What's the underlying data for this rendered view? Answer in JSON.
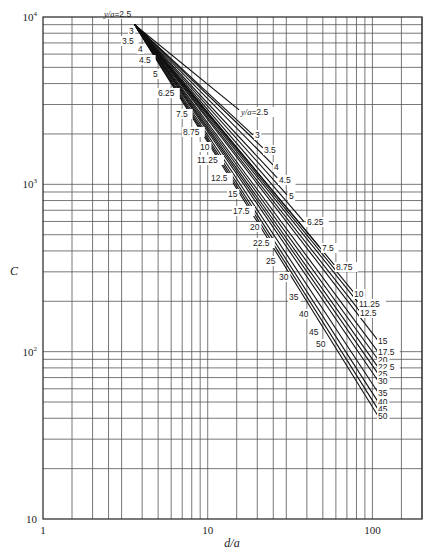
{
  "chart_data": {
    "type": "line",
    "title": "",
    "xlabel": "d/a",
    "ylabel": "C",
    "xscale": "log",
    "yscale": "log",
    "xlim": [
      1,
      200
    ],
    "ylim": [
      10,
      10000
    ],
    "grid": true,
    "legend_position": "inline labels at curve ends",
    "series_label_prefix": "y/a",
    "x_ticks": [
      "1",
      "10",
      "100"
    ],
    "y_ticks": [
      "10",
      "10^2",
      "10^3",
      "10^4"
    ],
    "x_gridlines": [
      1.5,
      2,
      2.5,
      3,
      4,
      5,
      6,
      7,
      8,
      9,
      10,
      15,
      20,
      25,
      30,
      40,
      50,
      60,
      70,
      80,
      90,
      100,
      150,
      200
    ],
    "y_gridlines": [
      20,
      30,
      40,
      50,
      60,
      70,
      80,
      90,
      100,
      200,
      300,
      400,
      500,
      600,
      700,
      800,
      900,
      1000,
      2000,
      3000,
      4000,
      5000,
      6000,
      7000,
      8000,
      9000
    ],
    "series": [
      {
        "name": "2.5",
        "label": "y/a=2.5",
        "x": [
          3.6,
          15.5
        ],
        "y": [
          9000,
          2785
        ]
      },
      {
        "name": "3",
        "label": "3",
        "x": [
          3.6,
          18.8
        ],
        "y": [
          9000,
          1977
        ]
      },
      {
        "name": "3.5",
        "label": "3.5",
        "x": [
          3.6,
          21.6
        ],
        "y": [
          9000,
          1650
        ]
      },
      {
        "name": "4",
        "label": "4",
        "x": [
          3.6,
          24.9
        ],
        "y": [
          9000,
          1306
        ]
      },
      {
        "name": "4.5",
        "label": "4.5",
        "x": [
          3.6,
          26.4
        ],
        "y": [
          9000,
          1093
        ]
      },
      {
        "name": "5",
        "label": "5",
        "x": [
          3.6,
          30.3
        ],
        "y": [
          9000,
          865
        ]
      },
      {
        "name": "6.25",
        "label": "6.25",
        "x": [
          3.6,
          38.5
        ],
        "y": [
          9000,
          597
        ]
      },
      {
        "name": "7.5",
        "label": "7.5",
        "x": [
          3.6,
          47.5
        ],
        "y": [
          9000,
          424
        ]
      },
      {
        "name": "8.75",
        "label": "8.75",
        "x": [
          3.6,
          58.7
        ],
        "y": [
          9000,
          330
        ]
      },
      {
        "name": "10",
        "label": "10",
        "x": [
          3.6,
          76.6
        ],
        "y": [
          9000,
          228
        ]
      },
      {
        "name": "11.25",
        "label": "11.25",
        "x": [
          3.6,
          81.1
        ],
        "y": [
          9000,
          199
        ]
      },
      {
        "name": "12.5",
        "label": "12.5",
        "x": [
          3.6,
          83.4
        ],
        "y": [
          9000,
          176
        ]
      },
      {
        "name": "15",
        "label": "15",
        "x": [
          3.6,
          107
        ],
        "y": [
          9000,
          118
        ]
      },
      {
        "name": "17.5",
        "label": "17.5",
        "x": [
          3.6,
          107
        ],
        "y": [
          9000,
          101
        ]
      },
      {
        "name": "20",
        "label": "20",
        "x": [
          3.6,
          107
        ],
        "y": [
          9000,
          91
        ]
      },
      {
        "name": "22.5",
        "label": "22.5",
        "x": [
          3.6,
          107
        ],
        "y": [
          9000,
          82
        ]
      },
      {
        "name": "25",
        "label": "25",
        "x": [
          3.6,
          107
        ],
        "y": [
          9000,
          75
        ]
      },
      {
        "name": "30",
        "label": "30",
        "x": [
          3.6,
          107
        ],
        "y": [
          9000,
          68
        ]
      },
      {
        "name": "35",
        "label": "35",
        "x": [
          3.6,
          107
        ],
        "y": [
          9000,
          58
        ]
      },
      {
        "name": "40",
        "label": "40",
        "x": [
          3.6,
          107
        ],
        "y": [
          9000,
          51
        ]
      },
      {
        "name": "45",
        "label": "45",
        "x": [
          3.6,
          107
        ],
        "y": [
          9000,
          46
        ]
      },
      {
        "name": "50",
        "label": "50",
        "x": [
          3.6,
          107
        ],
        "y": [
          9000,
          42
        ]
      }
    ],
    "left_labels": [
      {
        "text": "y/a=2.5",
        "px": 104,
        "py": 17
      },
      {
        "text": "3",
        "px": 129,
        "py": 34
      },
      {
        "text": "3.5",
        "px": 122,
        "py": 44
      },
      {
        "text": "4",
        "px": 138,
        "py": 52
      },
      {
        "text": "4.5",
        "px": 139,
        "py": 63
      },
      {
        "text": "5",
        "px": 153,
        "py": 77
      },
      {
        "text": "6.25",
        "px": 158,
        "py": 96
      },
      {
        "text": "7.5",
        "px": 176,
        "py": 117
      },
      {
        "text": "8.75",
        "px": 183,
        "py": 135
      },
      {
        "text": "10",
        "px": 200,
        "py": 150
      },
      {
        "text": "11.25",
        "px": 197,
        "py": 163
      },
      {
        "text": "12.5",
        "px": 211,
        "py": 181
      },
      {
        "text": "15",
        "px": 228,
        "py": 197
      },
      {
        "text": "17.5",
        "px": 233,
        "py": 214
      },
      {
        "text": "20",
        "px": 250,
        "py": 230
      },
      {
        "text": "22.5",
        "px": 253,
        "py": 246
      },
      {
        "text": "25",
        "px": 266,
        "py": 264
      },
      {
        "text": "30",
        "px": 279,
        "py": 280
      },
      {
        "text": "35",
        "px": 289,
        "py": 300
      },
      {
        "text": "40",
        "px": 299,
        "py": 317
      },
      {
        "text": "45",
        "px": 309,
        "py": 335
      },
      {
        "text": "50",
        "px": 316,
        "py": 347
      }
    ],
    "right_labels": [
      {
        "text": "y/a=2.5",
        "px": 241,
        "py": 115
      },
      {
        "text": "3",
        "px": 255,
        "py": 138
      },
      {
        "text": "3.5",
        "px": 264,
        "py": 153
      },
      {
        "text": "4",
        "px": 274,
        "py": 170
      },
      {
        "text": "4.5",
        "px": 279,
        "py": 183
      },
      {
        "text": "5",
        "px": 289,
        "py": 199
      },
      {
        "text": "6.25",
        "px": 307,
        "py": 225
      },
      {
        "text": "7.5",
        "px": 322,
        "py": 251
      },
      {
        "text": "8.75",
        "px": 336,
        "py": 270
      },
      {
        "text": "10",
        "px": 354,
        "py": 297
      },
      {
        "text": "11.25",
        "px": 359,
        "py": 307
      },
      {
        "text": "12.5",
        "px": 360,
        "py": 316
      },
      {
        "text": "15",
        "px": 378,
        "py": 344
      },
      {
        "text": "17.5",
        "px": 378,
        "py": 355
      },
      {
        "text": "20",
        "px": 378,
        "py": 363
      },
      {
        "text": "22.5",
        "px": 378,
        "py": 370
      },
      {
        "text": "25",
        "px": 378,
        "py": 377
      },
      {
        "text": "30",
        "px": 378,
        "py": 384
      },
      {
        "text": "35",
        "px": 378,
        "py": 396
      },
      {
        "text": "40",
        "px": 378,
        "py": 405
      },
      {
        "text": "45",
        "px": 378,
        "py": 412
      },
      {
        "text": "50",
        "px": 378,
        "py": 419
      }
    ]
  },
  "axes": {
    "x_title": "d/a",
    "y_title": "C",
    "x_tick_labels": [
      {
        "value": 1,
        "text": "1"
      },
      {
        "value": 10,
        "text": "10"
      },
      {
        "value": 100,
        "text": "100"
      }
    ],
    "y_tick_labels": [
      {
        "value": 10000,
        "base": "10",
        "exp": "4"
      },
      {
        "value": 1000,
        "base": "10",
        "exp": "3"
      },
      {
        "value": 100,
        "base": "10",
        "exp": "2"
      },
      {
        "value": 10,
        "base": "10",
        "exp": ""
      }
    ]
  },
  "layout": {
    "plot_left": 43,
    "plot_right": 422,
    "plot_top": 17,
    "plot_bottom": 519,
    "x_min": 1,
    "x_max": 200,
    "y_min": 10,
    "y_max": 10000
  }
}
